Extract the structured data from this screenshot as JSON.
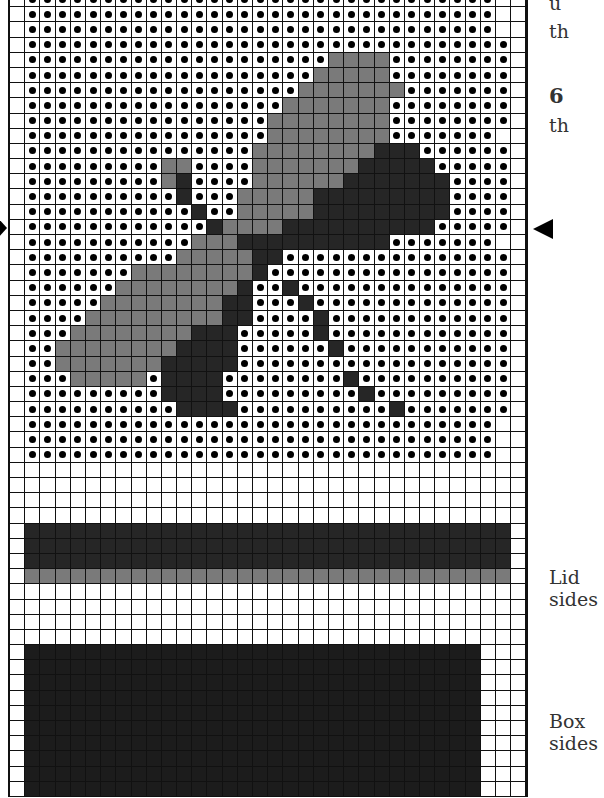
{
  "side_text": {
    "line1": "u",
    "line2": "th",
    "step_number": "6",
    "line3": "th",
    "lid_label_1": "Lid",
    "lid_label_2": "sides",
    "box_label_1": "Box",
    "box_label_2": "sides"
  },
  "markers": {
    "left_arrow": "center-marker-left",
    "right_arrow": "center-marker-right"
  },
  "legend_colors": {
    "empty": "#ffffff",
    "dot": "#000000",
    "mid_gray": "#7a7a7a",
    "dark": "#262626",
    "box_dark": "#1c1c1c"
  },
  "chart_data": {
    "type": "table",
    "columns": 34,
    "legend": {
      ".": "empty stitch",
      "o": "background (dot)",
      "g": "mid gray",
      "d": "dark",
      "k": "very dark (box sides)"
    },
    "rows": [
      ".ooooooooooooooooooooooooooooooo..",
      ".ooooooooooooooooooooooooooooooo..",
      ".ooooooooooooooooooooooooooooooo..",
      ".oooooooooooooooooooooooooooooooo.",
      ".ooooooooooooooooooooggggoooooooo.",
      ".ooooooooooooooooooogggggoooooooo.",
      ".oooooooooooooooooogggggggooooooo.",
      ".ooooooooooooooooogggggggoooooooo.",
      ".ooooooooooooooooggggggggoooooooo.",
      ".ooooooooooooooooggggggggooooooo..",
      ".oooooooooooooooggggggggdddoooooo.",
      ".oooooooooggoooogggggggdddddooooo.",
      ".ooooooooogdooooggggggdddddddoooo.",
      ".oooooooooodooogggggdddddddddoooo.",
      ".ooooooooooodoogggggdddddddddoooo.",
      ".oooooooooooodggggddddddddddooooo.",
      ".ooooooooooogggddddddddddooooooo..",
      ".oooooooooogggggddooooooooooooooo.",
      ".oooooooggggggggdoooooooooooooooo.",
      ".ooooooggggggggdoodoooooooooooooo.",
      ".oooooggggggggddooodooooooooooooo.",
      ".oooogggggggggddoooodoooooooooooo.",
      ".oooggggggggdddooooodoooooooooooo.",
      ".ooggggggggddddoooooodooooooooooo.",
      ".oogggggggdddddoooooooooooooooooo.",
      ".ooogggggoddddoooooooodoooooooooo.",
      ".oooooooooddddooooooooodooooooooo.",
      ".ooooooooooddddoooooooooodooooooo.",
      ".ooooooooooooooooooooooooooooooo..",
      ".ooooooooooooooooooooooooooooooo..",
      ".ooooooooooooooooooooooooooooooo..",
      "..................................",
      "..................................",
      "..................................",
      "..................................",
      ".dddddddddddddddddddddddddddddddd.",
      ".dddddddddddddddddddddddddddddddd.",
      ".dddddddddddddddddddddddddddddddd.",
      ".gggggggggggggggggggggggggggggggg.",
      "..................................",
      "..................................",
      "..................................",
      "..................................",
      ".kkkkkkkkkkkkkkkkkkkkkkkkkkkkkk...",
      ".kkkkkkkkkkkkkkkkkkkkkkkkkkkkkk...",
      ".kkkkkkkkkkkkkkkkkkkkkkkkkkkkkk...",
      ".kkkkkkkkkkkkkkkkkkkkkkkkkkkkkk...",
      ".kkkkkkkkkkkkkkkkkkkkkkkkkkkkkk...",
      ".kkkkkkkkkkkkkkkkkkkkkkkkkkkkkk...",
      ".kkkkkkkkkkkkkkkkkkkkkkkkkkkkkk...",
      ".kkkkkkkkkkkkkkkkkkkkkkkkkkkkkk...",
      ".kkkkkkkkkkkkkkkkkkkkkkkkkkkkkk...",
      ".kkkkkkkkkkkkkkkkkkkkkkkkkkkkkk..."
    ],
    "sections": [
      {
        "label": "Lid top (dragonfly motif)",
        "rows": [
          0,
          30
        ]
      },
      {
        "label": "Lid sides",
        "rows": [
          35,
          38
        ]
      },
      {
        "label": "Box sides",
        "rows": [
          43,
          52
        ]
      }
    ]
  }
}
